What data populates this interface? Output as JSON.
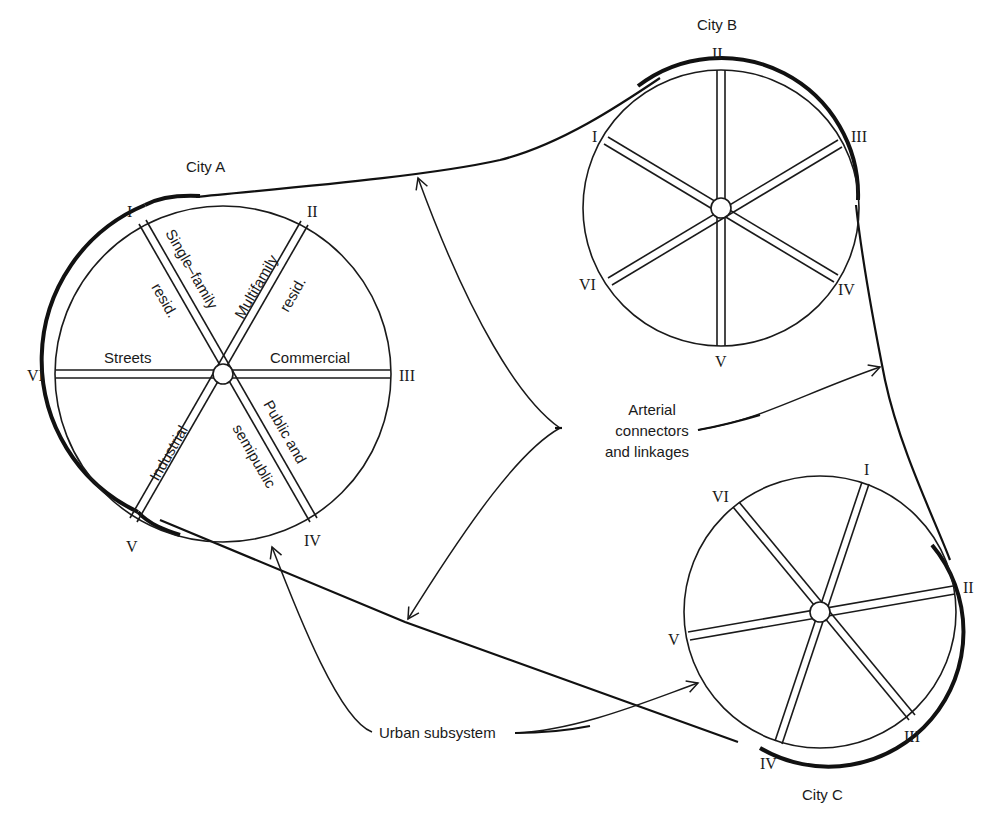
{
  "diagram": {
    "cities": [
      {
        "name": "City A",
        "center": [
          223,
          374
        ],
        "radius": 168,
        "spokes": [
          "I",
          "II",
          "III",
          "IV",
          "V",
          "VI"
        ],
        "sector_labels": [
          {
            "text": "Single–family",
            "position": "along spoke I"
          },
          {
            "text": "resid.",
            "position": "along spoke I"
          },
          {
            "text": "Multifamily",
            "position": "along spoke II"
          },
          {
            "text": "resid.",
            "position": "along spoke II"
          },
          {
            "text": "Commercial",
            "position": "along spoke III"
          },
          {
            "text": "Public and",
            "position": "along spoke IV"
          },
          {
            "text": "semipublic",
            "position": "along spoke IV"
          },
          {
            "text": "Industrial",
            "position": "along spoke V"
          },
          {
            "text": "Streets",
            "position": "along spoke VI"
          }
        ]
      },
      {
        "name": "City B",
        "center": [
          721,
          208
        ],
        "radius": 137,
        "spokes": [
          "I",
          "II",
          "III",
          "IV",
          "V",
          "VI"
        ]
      },
      {
        "name": "City C",
        "center": [
          820,
          612
        ],
        "radius": 135,
        "spokes": [
          "I",
          "II",
          "III",
          "IV",
          "V",
          "VI"
        ]
      }
    ],
    "callouts": {
      "arterial": [
        "Arterial",
        "connectors",
        "and linkages"
      ],
      "urban": "Urban subsystem"
    },
    "numerals": {
      "I": "I",
      "II": "II",
      "III": "III",
      "IV": "IV",
      "V": "V",
      "VI": "VI"
    },
    "labels": {
      "city_a": "City A",
      "city_b": "City B",
      "city_c": "City C",
      "a_single": "Single–family",
      "a_single_resid": "resid.",
      "a_multi": "Multifamily",
      "a_multi_resid": "resid.",
      "a_commercial": "Commercial",
      "a_public": "Public and",
      "a_semipublic": "semipublic",
      "a_industrial": "Industrial",
      "a_streets": "Streets",
      "arterial_1": "Arterial",
      "arterial_2": "connectors",
      "arterial_3": "and linkages",
      "urban": "Urban subsystem"
    }
  }
}
